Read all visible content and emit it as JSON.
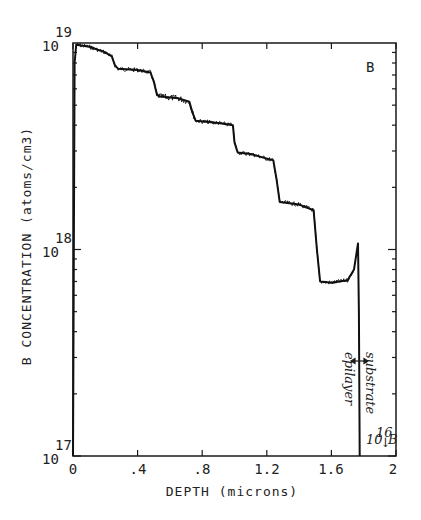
{
  "chart_data": {
    "type": "line",
    "title": "",
    "panel_label": "B",
    "xlabel": "DEPTH (microns)",
    "ylabel": "B CONCENTRATION (atoms/cm3)",
    "xlim": [
      0,
      2
    ],
    "ylim": [
      1e+17,
      1e+19
    ],
    "yscale": "log",
    "x_ticks": [
      "0",
      ".4",
      ".8",
      "1.2",
      "1.6",
      "2"
    ],
    "x_tick_values": [
      0,
      0.4,
      0.8,
      1.2,
      1.6,
      2.0
    ],
    "y_ticks": [
      {
        "base": "10",
        "exp": "19",
        "value": 1e+19
      },
      {
        "base": "10",
        "exp": "18",
        "value": 1e+18
      },
      {
        "base": "10",
        "exp": "17",
        "value": 1e+17
      }
    ],
    "grid": false,
    "series": [
      {
        "name": "B profile",
        "x": [
          0.0,
          0.01,
          0.02,
          0.1,
          0.2,
          0.24,
          0.26,
          0.28,
          0.4,
          0.48,
          0.5,
          0.52,
          0.54,
          0.65,
          0.72,
          0.74,
          0.76,
          0.9,
          0.99,
          1.0,
          1.02,
          1.1,
          1.24,
          1.26,
          1.28,
          1.4,
          1.49,
          1.51,
          1.53,
          1.6,
          1.7,
          1.74,
          1.765,
          1.77,
          1.775
        ],
        "y": [
          1e+17,
          8e+18,
          9.8e+18,
          9.6e+18,
          9e+18,
          8.6e+18,
          7.8e+18,
          7.5e+18,
          7.4e+18,
          7.2e+18,
          6.5e+18,
          5.6e+18,
          5.5e+18,
          5.4e+18,
          5.2e+18,
          4.6e+18,
          4.2e+18,
          4.1e+18,
          4e+18,
          3.3e+18,
          2.95e+18,
          2.9e+18,
          2.7e+18,
          2.2e+18,
          1.7e+18,
          1.65e+18,
          1.55e+18,
          1e+18,
          7e+17,
          6.9e+17,
          7.1e+17,
          8e+17,
          1.07e+18,
          5e+17,
          1e+17
        ]
      }
    ],
    "annotations": [
      {
        "text": "B",
        "position": "top-right"
      },
      {
        "text": "epilayer",
        "orientation": "vertical",
        "x": 1.73
      },
      {
        "text": "substrate",
        "orientation": "vertical",
        "x": 1.8
      },
      {
        "text": "↔",
        "meaning": "interface arrow",
        "x": 1.77
      },
      {
        "text": "10^16 ↓B",
        "meaning": "substrate boron below 1e16"
      }
    ],
    "interface_depth": 1.77
  },
  "labels": {
    "panel": "B",
    "xlabel": "DEPTH (microns)",
    "ylabel": "B CONCENTRATION (atoms/cm3)",
    "epilayer": "epilayer",
    "substrate": "substrate",
    "substrate_note_base": "10",
    "substrate_note_exp": "16",
    "substrate_note_arrow": "↓",
    "substrate_note_elem": "B",
    "xticks": [
      "0",
      ".4",
      ".8",
      "1.2",
      "1.6",
      "2"
    ],
    "y19_base": "10",
    "y19_exp": "19",
    "y18_base": "10",
    "y18_exp": "18",
    "y17_base": "10",
    "y17_exp": "17"
  }
}
